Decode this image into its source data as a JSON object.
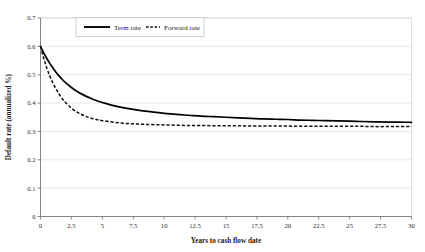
{
  "chart_data": {
    "type": "line",
    "title": "",
    "xlabel": "Years to cash flow date",
    "ylabel": "Default rate (annualized %)",
    "xlim": [
      0,
      30
    ],
    "ylim": [
      0,
      0.7
    ],
    "grid": true,
    "legend_position": "top-center",
    "xticks": [
      "0",
      "2.5",
      "5",
      "7.5",
      "10",
      "12.5",
      "15",
      "17.5",
      "20",
      "22.5",
      "25",
      "27.5",
      "30"
    ],
    "xtick_values": [
      0,
      2.5,
      5,
      7.5,
      10,
      12.5,
      15,
      17.5,
      20,
      22.5,
      25,
      27.5,
      30
    ],
    "yticks": [
      "0",
      "0.1",
      "0.2",
      "0.3",
      "0.4",
      "0.5",
      "0.6",
      "0.7"
    ],
    "ytick_values": [
      0,
      0.1,
      0.2,
      0.3,
      0.4,
      0.5,
      0.6,
      0.7
    ],
    "x": [
      0,
      0.25,
      0.5,
      0.75,
      1,
      1.25,
      1.5,
      1.75,
      2,
      2.5,
      3,
      3.5,
      4,
      4.5,
      5,
      6,
      7,
      8,
      9,
      10,
      11,
      12,
      13,
      14,
      15,
      16,
      17,
      18,
      19,
      20,
      21,
      22,
      23,
      24,
      25,
      26,
      27,
      28,
      29,
      30
    ],
    "series": [
      {
        "name": "Term rate",
        "style": "solid",
        "color": "#000000",
        "values": [
          0.6,
          0.578,
          0.558,
          0.54,
          0.524,
          0.509,
          0.496,
          0.484,
          0.473,
          0.455,
          0.44,
          0.428,
          0.418,
          0.409,
          0.402,
          0.39,
          0.381,
          0.374,
          0.369,
          0.364,
          0.36,
          0.357,
          0.354,
          0.352,
          0.35,
          0.348,
          0.346,
          0.344,
          0.343,
          0.342,
          0.34,
          0.339,
          0.338,
          0.337,
          0.336,
          0.335,
          0.334,
          0.333,
          0.333,
          0.332
        ]
      },
      {
        "name": "Forward rate",
        "style": "dashed",
        "color": "#111111",
        "values": [
          0.6,
          0.559,
          0.525,
          0.496,
          0.471,
          0.45,
          0.432,
          0.416,
          0.403,
          0.382,
          0.367,
          0.356,
          0.348,
          0.342,
          0.338,
          0.332,
          0.328,
          0.326,
          0.324,
          0.323,
          0.322,
          0.321,
          0.321,
          0.32,
          0.32,
          0.32,
          0.319,
          0.319,
          0.319,
          0.319,
          0.318,
          0.318,
          0.318,
          0.318,
          0.318,
          0.318,
          0.317,
          0.317,
          0.317,
          0.317
        ]
      }
    ]
  },
  "legend": {
    "term_label": "Term rate",
    "forward_label": "Forward rate"
  },
  "axes": {
    "x_title": "Years to cash flow date",
    "y_title": "Default rate (annualized %)"
  }
}
